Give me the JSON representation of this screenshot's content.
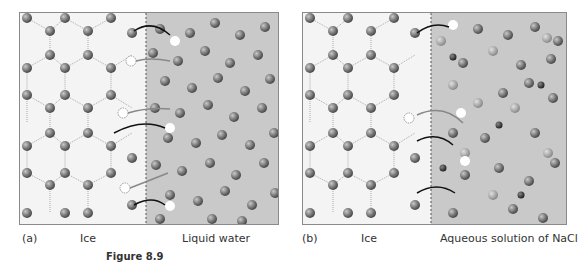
{
  "figure": {
    "title": "Figure 8.9",
    "panels": [
      {
        "id": "a",
        "letter": "(a)",
        "left_label": "Ice",
        "right_label": "Liquid water",
        "colors": {
          "ice_bg": "#f4f4f4",
          "liquid_bg": "#c9c9c9",
          "molecule": "#7a7a7a"
        }
      },
      {
        "id": "b",
        "letter": "(b)",
        "left_label": "Ice",
        "right_label": "Aqueous solution of NaCl",
        "colors": {
          "ice_bg": "#f4f4f4",
          "liquid_bg": "#c9c9c9",
          "molecule": "#7a7a7a",
          "ion_large": "#9a9a9a",
          "ion_small": "#3a3a3a"
        }
      }
    ]
  }
}
